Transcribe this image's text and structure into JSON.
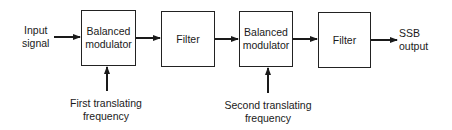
{
  "diagram": {
    "type": "block-diagram",
    "input": {
      "line1": "Input",
      "line2": "signal"
    },
    "output": {
      "line1": "SSB",
      "line2": "output"
    },
    "blocks": [
      {
        "id": "bm1",
        "line1": "Balanced",
        "line2": "modulator"
      },
      {
        "id": "f1",
        "label": "Filter"
      },
      {
        "id": "bm2",
        "line1": "Balanced",
        "line2": "modulator"
      },
      {
        "id": "f2",
        "label": "Filter"
      }
    ],
    "carriers": [
      {
        "target": "bm1",
        "line1": "First translating",
        "line2": "frequency"
      },
      {
        "target": "bm2",
        "line1": "Second translating",
        "line2": "frequency"
      }
    ],
    "connections": [
      [
        "input",
        "bm1"
      ],
      [
        "bm1",
        "f1"
      ],
      [
        "f1",
        "bm2"
      ],
      [
        "bm2",
        "f2"
      ],
      [
        "f2",
        "output"
      ],
      [
        "carrier1",
        "bm1"
      ],
      [
        "carrier2",
        "bm2"
      ]
    ],
    "colors": {
      "line": "#1a1a1a",
      "background": "#ffffff"
    }
  }
}
